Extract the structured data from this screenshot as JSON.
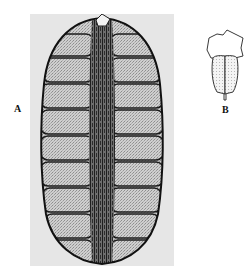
{
  "figure": {
    "panels": [
      {
        "id": "A",
        "label": "A",
        "kind": "micrograph",
        "description": "Longitudinal section of cone with stacked sporangia around a dark fibrous central axis"
      },
      {
        "id": "B",
        "label": "B",
        "kind": "line-drawing",
        "description": "Single sporangiophore: irregular sterile lamina above a paired, stippled two-lobed sporangium with a short stalk"
      }
    ],
    "colors": {
      "background": "#ffffff",
      "photo_bg": "#e6e6e6",
      "ink": "#1a1a1a",
      "stipple": "#b8b8b8"
    }
  }
}
